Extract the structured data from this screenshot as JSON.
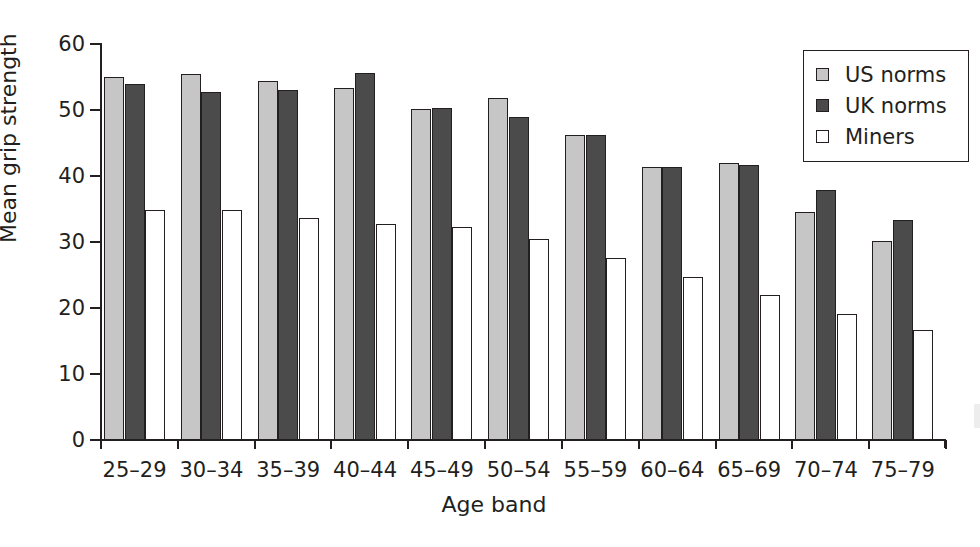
{
  "chart_data": {
    "type": "bar",
    "title": "",
    "xlabel": "Age band",
    "ylabel": "Mean grip strength",
    "ylim": [
      0,
      60
    ],
    "yticks": [
      0,
      10,
      20,
      30,
      40,
      50,
      60
    ],
    "grid": false,
    "legend_position": "top-right",
    "categories": [
      "25–29",
      "30–34",
      "35–39",
      "40–44",
      "45–49",
      "50–54",
      "55–59",
      "60–64",
      "65–69",
      "70–74",
      "75–79"
    ],
    "series": [
      {
        "name": "US norms",
        "color": "#c6c6c6",
        "values": [
          55.0,
          55.4,
          54.4,
          53.3,
          50.1,
          51.8,
          46.2,
          41.3,
          41.9,
          34.6,
          30.2
        ]
      },
      {
        "name": "UK norms",
        "color": "#4b4b4b",
        "values": [
          53.9,
          52.7,
          53.0,
          55.6,
          50.3,
          48.9,
          46.2,
          41.3,
          41.6,
          37.9,
          33.3
        ]
      },
      {
        "name": "Miners",
        "color": "#ffffff",
        "values": [
          34.9,
          34.8,
          33.6,
          32.7,
          32.3,
          30.5,
          27.6,
          24.7,
          22.0,
          19.1,
          16.6
        ]
      }
    ]
  },
  "axes": {
    "y_title": "Mean grip strength",
    "x_title": "Age band",
    "y_tick_labels": [
      "0",
      "10",
      "20",
      "30",
      "40",
      "50",
      "60"
    ],
    "x_tick_labels": [
      "25–29",
      "30–34",
      "35–39",
      "40–44",
      "45–49",
      "50–54",
      "55–59",
      "60–64",
      "65–69",
      "70–74",
      "75–79"
    ]
  },
  "legend": {
    "entries": [
      {
        "label": "US norms",
        "swatch": "light-gray-swatch"
      },
      {
        "label": "UK norms",
        "swatch": "dark-gray-swatch"
      },
      {
        "label": "Miners",
        "swatch": "white-swatch"
      }
    ]
  }
}
